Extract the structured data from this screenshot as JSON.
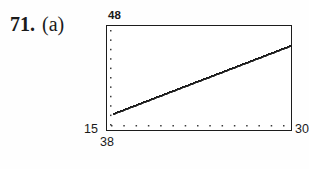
{
  "problem": {
    "number": "71.",
    "part": "(a)"
  },
  "plot": {
    "ymax_label": "48",
    "ymin_label": "15",
    "xmin_label": "38",
    "xmax_label": "30",
    "frame_color": "#1c1c1c",
    "line_color": "#1a1a1a",
    "tick_color": "#3a3a3a",
    "background": "#ffffff"
  },
  "chart_data": {
    "type": "line",
    "title": "",
    "xlabel": "",
    "ylabel": "",
    "xlim": [
      38,
      30
    ],
    "ylim": [
      15,
      48
    ],
    "grid": false,
    "legend": null,
    "x_tick_count": 15,
    "y_tick_count": 11,
    "tick_style": "dotted-inner-axis",
    "series": [
      {
        "name": "regression-line",
        "x": [
          38.0,
          39.0,
          40.0,
          41.0,
          42.0,
          43.0,
          44.0,
          45.0,
          46.0,
          47.0,
          48.0,
          49.0,
          50.0,
          51.0,
          52.0,
          53.0,
          54.0
        ],
        "y": [
          20.6,
          21.6,
          22.6,
          23.6,
          24.6,
          25.5,
          26.5,
          27.5,
          28.5,
          29.5,
          30.5,
          31.5,
          32.4,
          33.4,
          34.4,
          35.4,
          36.4
        ]
      }
    ],
    "line_endpoints": {
      "start": {
        "x_px": 7,
        "y_px": 88
      },
      "end": {
        "x_px": 184,
        "y_px": 20
      }
    }
  }
}
